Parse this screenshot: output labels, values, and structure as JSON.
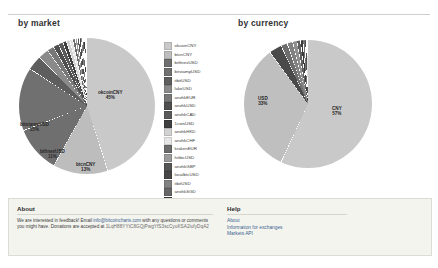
{
  "page": {
    "background": "#ffffff",
    "panel_bg": "#f4f4ef"
  },
  "charts": [
    {
      "id": "by-market",
      "title": "by market",
      "legend_position": "right"
    },
    {
      "id": "by-currency",
      "title": "by currency",
      "legend_position": "right"
    }
  ],
  "chart_data": [
    {
      "type": "pie",
      "title": "by market",
      "xlabel": "",
      "ylabel": "",
      "legend_position": "right",
      "categories": [
        "okcoinCNY",
        "btcnCNY",
        "bitfinexUSD",
        "bitstampUSD",
        "itbitUSD",
        "lakeUSD",
        "anxhkEUR",
        "anxhkUSD",
        "anxhkCAD",
        "1coinUSD",
        "anxhkHKD",
        "anxhkCHF",
        "krakenEUR",
        "hitbtcUSD",
        "anxhkGBP",
        "localbtcUSD",
        "itbitUSD2",
        "anxhkSGD",
        "anxhkJPY",
        "anxhkNZD",
        "anxhkAUD",
        "anxhkCNY"
      ],
      "values": [
        45,
        13,
        11,
        15,
        3.5,
        2.5,
        1.6,
        1.3,
        1.1,
        0.9,
        0.8,
        0.7,
        0.6,
        0.5,
        0.45,
        0.4,
        0.35,
        0.3,
        0.25,
        0.2,
        0.15,
        0.1
      ],
      "labels_shown": [
        {
          "name": "okcoinCNY",
          "pct": "45%"
        },
        {
          "name": "bitstampUSD",
          "pct": "15%"
        },
        {
          "name": "btfinexUSD",
          "pct": "11%"
        },
        {
          "name": "btcnCNY",
          "pct": "13%"
        }
      ],
      "legend": [
        {
          "label": "okcoinCNY",
          "color": "#c9c9c9"
        },
        {
          "label": "btcnCNY",
          "color": "#bdbdbd"
        },
        {
          "label": "bitfinexUSD",
          "color": "#6f6f6f"
        },
        {
          "label": "bitstampUSD",
          "color": "#707070"
        },
        {
          "label": "itbitUSD",
          "color": "#5e5e5e"
        },
        {
          "label": "lakeUSD",
          "color": "#8a8a8a"
        },
        {
          "label": "anxhkEUR",
          "color": "#787878"
        },
        {
          "label": "anxhkUSD",
          "color": "#4f4f4f"
        },
        {
          "label": "anxhkCAD",
          "color": "#5a5a5a"
        },
        {
          "label": "1coinUSD",
          "color": "#3f3f3f"
        },
        {
          "label": "anxhkHKD",
          "color": "#d2d2d2"
        },
        {
          "label": "anxhkCHF",
          "color": "#e6e6e6"
        },
        {
          "label": "krakenEUR",
          "color": "#6b6b6b"
        },
        {
          "label": "hitbtcUSD",
          "color": "#9a9a9a"
        },
        {
          "label": "anxhkGBP",
          "color": "#555555"
        },
        {
          "label": "localbtcUSD",
          "color": "#474747"
        },
        {
          "label": "itbitUSD",
          "color": "#828282"
        },
        {
          "label": "anxhkSGD",
          "color": "#676767"
        },
        {
          "label": "anxhkJPY",
          "color": "#3b3b3b"
        },
        {
          "label": "anxhkNZD",
          "color": "#5c5c5c"
        },
        {
          "label": "anxhkAUD",
          "color": "#e2e2e2"
        },
        {
          "label": "anxhkCNY",
          "color": "#cdcdcd"
        }
      ]
    },
    {
      "type": "pie",
      "title": "by currency",
      "xlabel": "",
      "ylabel": "",
      "legend_position": "right",
      "categories": [
        "CNY",
        "USD",
        "EUR",
        "GBP",
        "CAD",
        "SGD",
        "HKD",
        "AUD",
        "CHF",
        "NZD",
        "JPY"
      ],
      "values": [
        57,
        33,
        3.2,
        1.6,
        1.4,
        1.1,
        0.9,
        0.6,
        0.5,
        0.4,
        0.3
      ],
      "labels_shown": [
        {
          "name": "USD",
          "pct": "33%"
        },
        {
          "name": "CNY",
          "pct": "57%"
        }
      ],
      "legend": [
        {
          "label": "CNY",
          "color": "#c9c9c9"
        },
        {
          "label": "USD",
          "color": "#bfbfbf"
        },
        {
          "label": "EUR",
          "color": "#4a4a4a"
        },
        {
          "label": "GBP",
          "color": "#6e6e6e"
        },
        {
          "label": "CAD",
          "color": "#828282"
        },
        {
          "label": "SGD",
          "color": "#8f8f8f"
        },
        {
          "label": "HKD",
          "color": "#5f5f5f"
        },
        {
          "label": "AUD",
          "color": "#3a3a3a"
        },
        {
          "label": "CHF",
          "color": "#707070"
        },
        {
          "label": "NZD",
          "color": "#4f4f4f"
        },
        {
          "label": "JPY",
          "color": "#dedede"
        }
      ]
    }
  ],
  "footer": {
    "about": {
      "heading": "About",
      "line1_pre": "We are interested in feedback! Email ",
      "email": "info@bitcoincharts.com",
      "line1_post": " with any",
      "line2": "questions or comments you might have. Donations are accepted at",
      "address": "1LqH88YYtC8GQjPwgYfS3scCyuKSA2iufyDqA2"
    },
    "help": {
      "heading": "Help",
      "links": [
        "About",
        "Information for exchanges",
        "Markets API"
      ]
    }
  }
}
